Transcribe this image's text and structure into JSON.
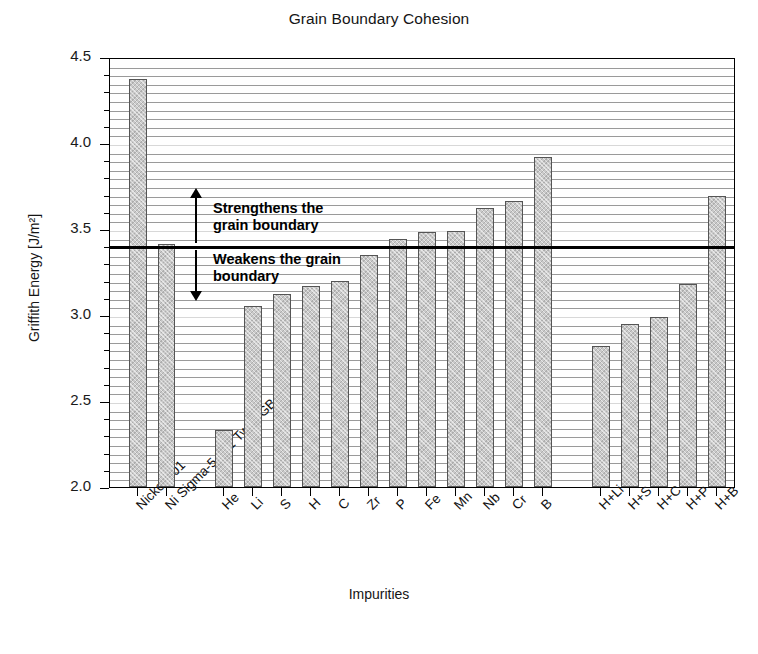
{
  "chart_data": {
    "type": "bar",
    "title": "Grain Boundary Cohesion",
    "xlabel": "Impurities",
    "ylabel": "Griffith Energy [J/m²]",
    "ylim": [
      2.0,
      4.5
    ],
    "ytick_labels": [
      "2.0",
      "2.5",
      "3.0",
      "3.5",
      "4.0",
      "4.5"
    ],
    "ytick_values": [
      2.0,
      2.5,
      3.0,
      3.5,
      4.0,
      4.5
    ],
    "yminor_step": 0.05,
    "grid": true,
    "legend": "none",
    "threshold_value": 3.41,
    "categories": [
      "Nickel 001",
      "Ni Sigma-5 001 Twist GB",
      "He",
      "Li",
      "S",
      "H",
      "C",
      "Zr",
      "P",
      "Fe",
      "Mn",
      "Nb",
      "Cr",
      "B",
      "H+Li",
      "H+S",
      "H+C",
      "H+P",
      "H+B"
    ],
    "values": [
      4.37,
      3.41,
      2.33,
      3.05,
      3.12,
      3.17,
      3.2,
      3.35,
      3.44,
      3.48,
      3.49,
      3.62,
      3.66,
      3.92,
      2.82,
      2.95,
      2.99,
      3.18,
      3.69
    ],
    "gaps_after": [
      1,
      13
    ],
    "annotations": [
      {
        "id": "strengthens",
        "text_lines": [
          "Strengthens the",
          "grain boundary"
        ],
        "direction": "up"
      },
      {
        "id": "weakens",
        "text_lines": [
          "Weakens the grain",
          "boundary"
        ],
        "direction": "down"
      }
    ]
  }
}
